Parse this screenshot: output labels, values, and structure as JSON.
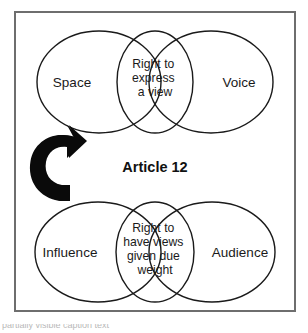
{
  "figure": {
    "title_center": "Article 12",
    "frame_color": "#6e6e6e",
    "stroke_color": "#1a1a1a",
    "arrow_color": "#0a0a0a",
    "background": "#ffffff"
  },
  "top_group": {
    "left_label": "Space",
    "right_label": "Voice",
    "center_lines": [
      "Right to",
      "express",
      "a view"
    ]
  },
  "bottom_group": {
    "left_label": "Influence",
    "right_label": "Audience",
    "center_lines": [
      "Right to",
      "have views",
      "given due",
      "weight"
    ]
  },
  "arrows": {
    "left_arrow_name": "curved-arrow-left",
    "right_arrow_name": "curved-arrow-right"
  },
  "caption": {
    "clipped_text": "partially visible caption text"
  }
}
